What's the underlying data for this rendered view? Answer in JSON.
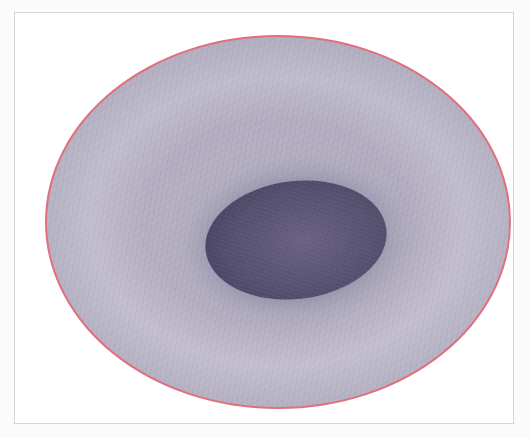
{
  "image": {
    "subject": "stylized-cell-illustration",
    "caption": "",
    "frame": {
      "border_color": "#d8d6d4",
      "background_color": "#ffffff"
    },
    "cell": {
      "name": "cell-body",
      "membrane_color": "#e0707c",
      "cytoplasm_color": "#b3aec1",
      "texture": "fine mottled fibrous speckle"
    },
    "nucleus": {
      "name": "nucleus",
      "color": "#554f6e",
      "highlight_color": "#6b6385",
      "shape": "ellipse",
      "rotation_degrees": -7
    },
    "canvas": {
      "width": 530,
      "height": 438,
      "background_color": "#fbfbfb"
    }
  }
}
